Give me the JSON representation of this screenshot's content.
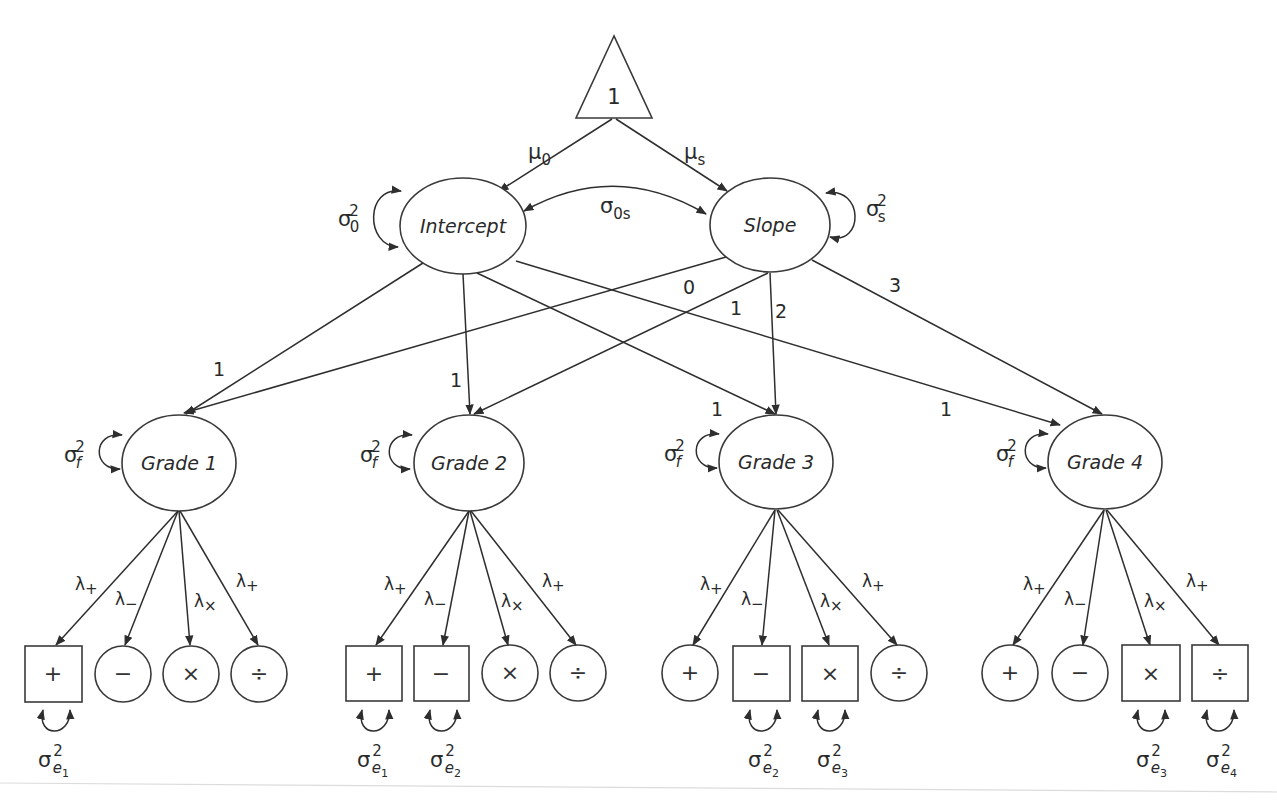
{
  "diagram": {
    "constant": {
      "label": "1"
    },
    "growth_factors": {
      "intercept": {
        "label": "Intercept",
        "mean_label": "μ",
        "mean_sub": "0",
        "var_label": "σ",
        "var_sub": "0",
        "var_sup": "2"
      },
      "slope": {
        "label": "Slope",
        "mean_label": "μ",
        "mean_sub": "s",
        "var_label": "σ",
        "var_sub": "s",
        "var_sup": "2"
      },
      "covariance": {
        "label": "σ",
        "sub": "0s"
      }
    },
    "intercept_loadings": [
      "1",
      "1",
      "1",
      "1"
    ],
    "slope_loadings": [
      "0",
      "1",
      "2",
      "3"
    ],
    "grades": [
      {
        "label": "Grade 1",
        "var_label": "σ",
        "var_sub": "f",
        "var_sup": "2",
        "indicators": [
          {
            "symbol": "+",
            "shape": "square",
            "loading": "λ",
            "loading_sub": "+",
            "residual": {
              "label": "σ",
              "sub": "e",
              "subsub": "1",
              "sup": "2"
            }
          },
          {
            "symbol": "−",
            "shape": "circle",
            "loading": "λ",
            "loading_sub": "−"
          },
          {
            "symbol": "×",
            "shape": "circle",
            "loading": "λ",
            "loading_sub": "×"
          },
          {
            "symbol": "÷",
            "shape": "circle",
            "loading": "λ",
            "loading_sub": "+"
          }
        ]
      },
      {
        "label": "Grade 2",
        "var_label": "σ",
        "var_sub": "f",
        "var_sup": "2",
        "indicators": [
          {
            "symbol": "+",
            "shape": "square",
            "loading": "λ",
            "loading_sub": "+",
            "residual": {
              "label": "σ",
              "sub": "e",
              "subsub": "1",
              "sup": "2"
            }
          },
          {
            "symbol": "−",
            "shape": "square",
            "loading": "λ",
            "loading_sub": "−",
            "residual": {
              "label": "σ",
              "sub": "e",
              "subsub": "2",
              "sup": "2"
            }
          },
          {
            "symbol": "×",
            "shape": "circle",
            "loading": "λ",
            "loading_sub": "×"
          },
          {
            "symbol": "÷",
            "shape": "circle",
            "loading": "λ",
            "loading_sub": "+"
          }
        ]
      },
      {
        "label": "Grade 3",
        "var_label": "σ",
        "var_sub": "f",
        "var_sup": "2",
        "indicators": [
          {
            "symbol": "+",
            "shape": "circle",
            "loading": "λ",
            "loading_sub": "+"
          },
          {
            "symbol": "−",
            "shape": "square",
            "loading": "λ",
            "loading_sub": "−",
            "residual": {
              "label": "σ",
              "sub": "e",
              "subsub": "2",
              "sup": "2"
            }
          },
          {
            "symbol": "×",
            "shape": "square",
            "loading": "λ",
            "loading_sub": "×",
            "residual": {
              "label": "σ",
              "sub": "e",
              "subsub": "3",
              "sup": "2"
            }
          },
          {
            "symbol": "÷",
            "shape": "circle",
            "loading": "λ",
            "loading_sub": "+"
          }
        ]
      },
      {
        "label": "Grade 4",
        "var_label": "σ",
        "var_sub": "f",
        "var_sup": "2",
        "indicators": [
          {
            "symbol": "+",
            "shape": "circle",
            "loading": "λ",
            "loading_sub": "+"
          },
          {
            "symbol": "−",
            "shape": "circle",
            "loading": "λ",
            "loading_sub": "−"
          },
          {
            "symbol": "×",
            "shape": "square",
            "loading": "λ",
            "loading_sub": "×",
            "residual": {
              "label": "σ",
              "sub": "e",
              "subsub": "3",
              "sup": "2"
            }
          },
          {
            "symbol": "÷",
            "shape": "square",
            "loading": "λ",
            "loading_sub": "+",
            "residual": {
              "label": "σ",
              "sub": "e",
              "subsub": "4",
              "sup": "2"
            }
          }
        ]
      }
    ],
    "colors": {
      "stroke": "#2e2e2e",
      "text": "#2a2a2a",
      "background": "#ffffff"
    }
  }
}
